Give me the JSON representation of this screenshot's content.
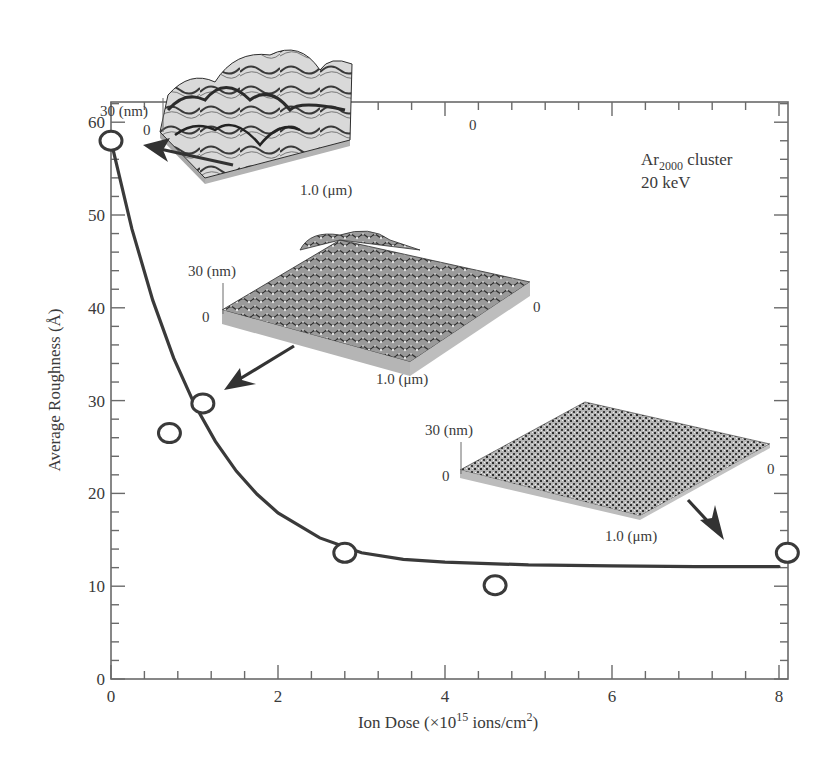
{
  "chart_data": {
    "type": "scatter",
    "title": "",
    "xlabel": "Ion Dose (×10^15 ions/cm^2)",
    "xlabel_parts": {
      "main": "Ion Dose (×10",
      "sup1": "15",
      "mid": " ions/cm",
      "sup2": "2",
      "end": ")"
    },
    "ylabel": "Average Roughness (Å)",
    "xlim": [
      0,
      8.8
    ],
    "ylim": [
      0,
      62
    ],
    "x_ticks": [
      0,
      2,
      4,
      6,
      8
    ],
    "x_tick_labels": [
      "0",
      "2",
      "4",
      "6",
      "8"
    ],
    "y_ticks": [
      0,
      10,
      20,
      30,
      40,
      50,
      60
    ],
    "y_tick_labels": [
      "0",
      "10",
      "20",
      "30",
      "40",
      "50",
      "60"
    ],
    "grid": false,
    "series": [
      {
        "name": "Measured average roughness",
        "marker": "open-circle",
        "x": [
          0,
          0.7,
          1.1,
          2.8,
          4.6,
          8.1
        ],
        "y": [
          58,
          26.5,
          29.7,
          13.6,
          10.1,
          13.6
        ]
      },
      {
        "name": "Fit curve (exponential decay)",
        "style": "line",
        "x": [
          0,
          0.25,
          0.5,
          0.75,
          1,
          1.25,
          1.5,
          1.75,
          2,
          2.5,
          3,
          3.5,
          4,
          5,
          6,
          7,
          8
        ],
        "y": [
          58,
          48.5,
          40.8,
          34.6,
          29.6,
          25.6,
          22.4,
          19.9,
          17.9,
          15.2,
          13.6,
          12.9,
          12.6,
          12.3,
          12.2,
          12.1,
          12.1
        ]
      }
    ],
    "annotations": [
      {
        "text": "Ar2000 cluster",
        "base": "Ar",
        "sub": "2000",
        "rest": " cluster"
      },
      {
        "text": "20 keV"
      }
    ],
    "insets": [
      {
        "name": "AFM image at dose 0",
        "z_label": "30 (nm)",
        "z_zero": "0",
        "x_zero": "0",
        "lateral_label": "1.0 (μm)",
        "points_to": [
          0,
          58
        ]
      },
      {
        "name": "AFM image at dose ~1.1",
        "z_label": "30 (nm)",
        "z_zero": "0",
        "x_zero": "0",
        "lateral_label": "1.0 (μm)",
        "points_to": [
          1.1,
          29.7
        ]
      },
      {
        "name": "AFM image at dose 8",
        "z_label": "30 (nm)",
        "z_zero": "0",
        "x_zero": "0",
        "lateral_label": "1.0 (μm)",
        "points_to": [
          8.1,
          13.6
        ]
      }
    ]
  }
}
